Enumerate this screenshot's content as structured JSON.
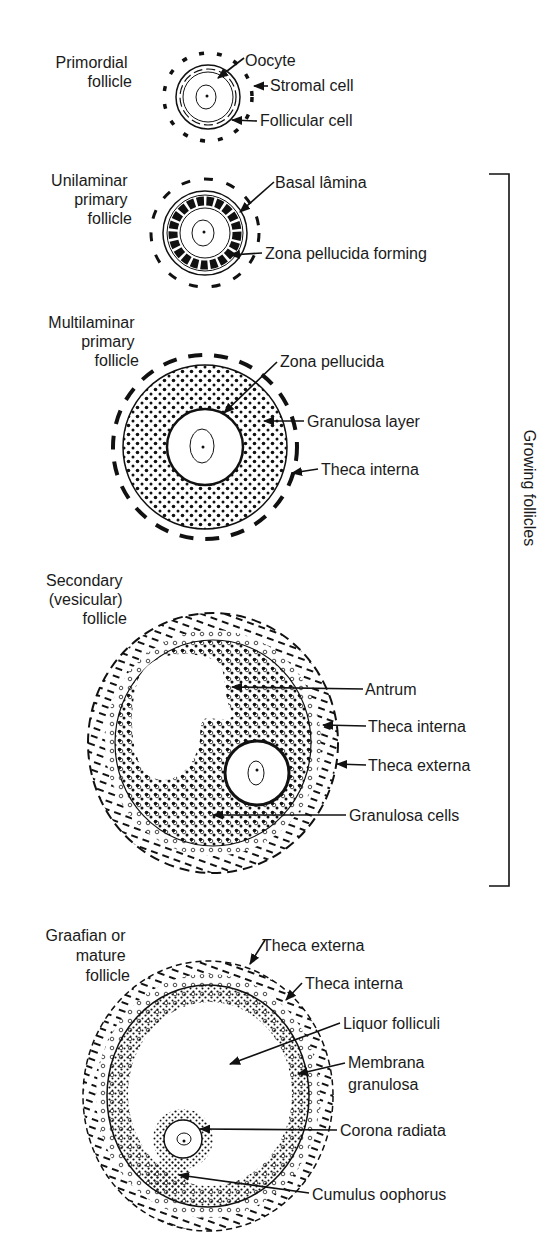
{
  "figure": {
    "bracket_label": "Growing follicles",
    "stages": [
      {
        "id": "primordial",
        "name_lines": [
          "Primordial",
          "follicle"
        ],
        "labels": [
          "Oocyte",
          "Stromal cell",
          "Follicular cell"
        ]
      },
      {
        "id": "unilaminar",
        "name_lines": [
          "Unilaminar",
          "primary",
          "follicle"
        ],
        "labels": [
          "Basal lâmina",
          "Zona pellucida forming"
        ]
      },
      {
        "id": "multilaminar",
        "name_lines": [
          "Multilaminar",
          "primary",
          "follicle"
        ],
        "labels": [
          "Zona pellucida",
          "Granulosa layer",
          "Theca interna"
        ]
      },
      {
        "id": "secondary",
        "name_lines": [
          "Secondary",
          "(vesicular)",
          "follicle"
        ],
        "labels": [
          "Antrum",
          "Theca interna",
          "Theca externa",
          "Granulosa cells"
        ]
      },
      {
        "id": "graafian",
        "name_lines": [
          "Graafian or",
          "mature",
          "follicle"
        ],
        "labels": [
          "Theca externa",
          "Theca interna",
          "Liquor folliculi",
          "Membrana",
          "granulosa",
          "Corona radiata",
          "Cumulus oophorus"
        ]
      }
    ]
  }
}
